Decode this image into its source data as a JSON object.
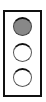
{
  "indicator": {
    "lamps": [
      {
        "position": "top",
        "state": "on",
        "color": "#888888"
      },
      {
        "position": "middle",
        "state": "off",
        "color": "#ffffff"
      },
      {
        "position": "bottom",
        "state": "off",
        "color": "#ffffff"
      }
    ]
  }
}
